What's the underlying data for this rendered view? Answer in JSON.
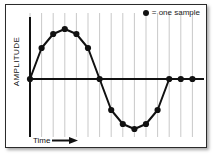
{
  "figure": {
    "kind": "sampled-sine-wave-diagram",
    "background": "#ffffff",
    "border_color": "#2b2b2b",
    "ink_color": "#111111",
    "gridline_color": "#c9c9c9"
  },
  "legend": {
    "marker_icon": "filled-circle-icon",
    "text": "= one sample",
    "marker_color": "#111111"
  },
  "axes": {
    "ylabel": "AMPLITUDE",
    "xlabel": "Time",
    "x_arrow_icon": "right-arrow-icon",
    "axis_color": "#111111",
    "axis_width": 2
  },
  "chart_data": {
    "type": "line",
    "title": "",
    "xlabel": "Time",
    "ylabel": "AMPLITUDE",
    "grid": true,
    "grid_axis": "x",
    "legend_position": "top-right",
    "xlim": [
      0,
      15
    ],
    "ylim": [
      -1.08,
      1.08
    ],
    "marker": "filled-circle",
    "marker_count": 15,
    "series": [
      {
        "name": "one sample",
        "x": [
          0,
          1,
          2,
          3,
          4,
          5,
          6,
          7,
          8,
          9,
          10,
          11,
          12,
          13,
          14
        ],
        "values": [
          0.0,
          0.62,
          0.9,
          1.0,
          0.9,
          0.62,
          0.0,
          -0.62,
          -0.9,
          -1.0,
          -0.9,
          -0.62,
          0.0,
          0.0,
          0.0
        ]
      }
    ]
  },
  "gridlines": {
    "count": 15,
    "x": [
      0,
      1,
      2,
      3,
      4,
      5,
      6,
      7,
      8,
      9,
      10,
      11,
      12,
      13,
      14
    ]
  }
}
